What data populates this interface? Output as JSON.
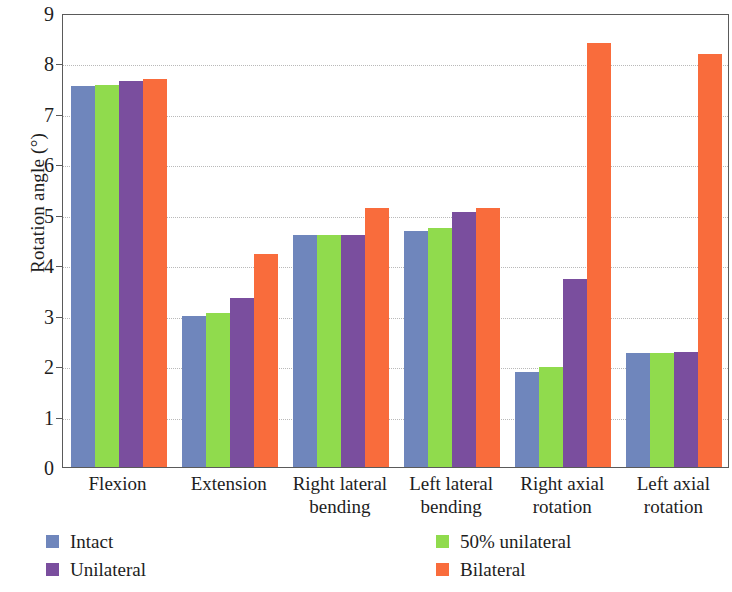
{
  "chart_data": {
    "type": "bar",
    "title": "",
    "xlabel": "",
    "ylabel": "Rotation angle (°)",
    "ylim": [
      0,
      9
    ],
    "ytick_labels": [
      "0",
      "1",
      "2",
      "3",
      "4",
      "5",
      "6",
      "7",
      "8",
      "9"
    ],
    "ytick_values": [
      0,
      1,
      2,
      3,
      4,
      5,
      6,
      7,
      8,
      9
    ],
    "grid": true,
    "legend_position": "bottom",
    "categories": [
      "Flexion",
      "Extension",
      "Right lateral bending",
      "Left lateral bending",
      "Right axial rotation",
      "Left axial rotation"
    ],
    "category_lines": [
      [
        "Flexion"
      ],
      [
        "Extension"
      ],
      [
        "Right lateral",
        "bending"
      ],
      [
        "Left lateral",
        "bending"
      ],
      [
        "Right axial",
        "rotation"
      ],
      [
        "Left axial",
        "rotation"
      ]
    ],
    "series": [
      {
        "name": "Intact",
        "color": "#6F86BC",
        "values": [
          7.55,
          3.0,
          4.6,
          4.68,
          1.88,
          2.27
        ]
      },
      {
        "name": "50% unilateral",
        "color": "#90DB4D",
        "values": [
          7.58,
          3.05,
          4.6,
          4.73,
          1.98,
          2.27
        ]
      },
      {
        "name": "Unilateral",
        "color": "#7A4E9E",
        "values": [
          7.65,
          3.36,
          4.6,
          5.06,
          3.72,
          2.28
        ]
      },
      {
        "name": "Bilateral",
        "color": "#F96C3C",
        "values": [
          7.7,
          4.22,
          5.13,
          5.13,
          8.4,
          8.18
        ]
      }
    ]
  },
  "legend": {
    "items": [
      {
        "label": "Intact",
        "color": "#6F86BC"
      },
      {
        "label": "50% unilateral",
        "color": "#90DB4D"
      },
      {
        "label": "Unilateral",
        "color": "#7A4E9E"
      },
      {
        "label": "Bilateral",
        "color": "#F96C3C"
      }
    ]
  },
  "axes": {
    "y_title": "Rotation angle (°)"
  }
}
